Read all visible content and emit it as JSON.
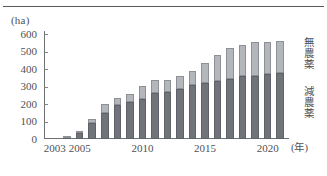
{
  "figure": {
    "unit_label": "(ha)",
    "x_unit_label": "(年)"
  },
  "axis": {
    "y_ticks": [
      0,
      100,
      200,
      300,
      400,
      500,
      600
    ],
    "y_tick_labels": [
      "0",
      "100",
      "200",
      "300",
      "400",
      "500",
      "600"
    ],
    "y_min": 0,
    "y_max": 600,
    "x_tick_labels": [
      "2003",
      "2005",
      "2010",
      "2015",
      "2020"
    ],
    "x_tick_years": [
      2003,
      2005,
      2010,
      2015,
      2020
    ]
  },
  "series_labels": {
    "pesticide_free": "無農薬",
    "reduced_pesticide": "減農薬"
  },
  "colors": {
    "reduced_pesticide": "#70737a",
    "pesticide_free": "#b3b6ba",
    "axis": "#6d7074",
    "text": "#4f5154",
    "rule": "#55585c"
  },
  "chart_data": {
    "type": "bar",
    "title": "",
    "subtitle": "",
    "xlabel": "(年)",
    "ylabel": "(ha)",
    "ylim": [
      0,
      600
    ],
    "grid": false,
    "stacked": true,
    "legend_position": "right",
    "categories": [
      "2003",
      "2004",
      "2005",
      "2006",
      "2007",
      "2008",
      "2009",
      "2010",
      "2011",
      "2012",
      "2013",
      "2014",
      "2015",
      "2016",
      "2017",
      "2018",
      "2019",
      "2020",
      "2021"
    ],
    "series": [
      {
        "name": "減農薬",
        "values": [
          0,
          5,
          35,
          90,
          150,
          195,
          210,
          230,
          265,
          270,
          285,
          310,
          320,
          330,
          345,
          360,
          362,
          370,
          380
        ]
      },
      {
        "name": "無農薬",
        "values": [
          0,
          2,
          8,
          25,
          52,
          40,
          50,
          75,
          70,
          68,
          75,
          80,
          112,
          152,
          175,
          180,
          192,
          183,
          180
        ]
      }
    ],
    "totals": [
      0,
      7,
      43,
      115,
      202,
      235,
      260,
      305,
      335,
      338,
      360,
      390,
      432,
      482,
      520,
      540,
      554,
      553,
      560
    ]
  }
}
